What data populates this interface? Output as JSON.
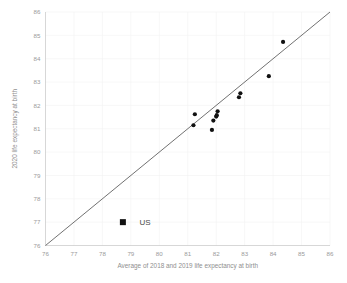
{
  "chart_data": {
    "type": "scatter",
    "title": "",
    "xlabel": "Average of 2018 and 2019 life expectancy at birth",
    "ylabel": "2020 life expectancy at birth",
    "xlim": [
      76,
      86
    ],
    "ylim": [
      76,
      86
    ],
    "xticks": [
      76,
      77,
      78,
      79,
      80,
      81,
      82,
      83,
      84,
      85,
      86
    ],
    "yticks": [
      76,
      77,
      78,
      79,
      80,
      81,
      82,
      83,
      84,
      85,
      86
    ],
    "xtick_labels": [
      "76",
      "77",
      "78",
      "79",
      "80",
      "81",
      "82",
      "83",
      "84",
      "85",
      "86"
    ],
    "ytick_labels": [
      "76",
      "77",
      "78",
      "79",
      "80",
      "81",
      "82",
      "83",
      "84",
      "85",
      "86"
    ],
    "grid": true,
    "legend_position": "inside-lower-left",
    "series": [
      {
        "name": "Other countries",
        "marker": "circle",
        "color": "#111111",
        "points": [
          {
            "x": 81.2,
            "y": 81.15
          },
          {
            "x": 81.25,
            "y": 81.62
          },
          {
            "x": 81.85,
            "y": 80.95
          },
          {
            "x": 81.9,
            "y": 81.35
          },
          {
            "x": 82.0,
            "y": 81.52
          },
          {
            "x": 82.02,
            "y": 81.58
          },
          {
            "x": 82.05,
            "y": 81.75
          },
          {
            "x": 82.8,
            "y": 82.35
          },
          {
            "x": 82.85,
            "y": 82.52
          },
          {
            "x": 83.85,
            "y": 83.25
          },
          {
            "x": 84.35,
            "y": 84.72
          }
        ]
      },
      {
        "name": "US",
        "marker": "square",
        "color": "#111111",
        "points": [
          {
            "x": 78.72,
            "y": 77.0
          }
        ]
      }
    ],
    "reference_line": {
      "name": "y = x identity line",
      "from": {
        "x": 76,
        "y": 76
      },
      "to": {
        "x": 86,
        "y": 86
      },
      "color": "#4d4d4d"
    },
    "annotations": [
      {
        "name": "us-label",
        "text": "US",
        "x": 79.3,
        "y": 77.0
      }
    ]
  },
  "legend": {
    "us_label": "US"
  },
  "colors": {
    "marker": "#111111",
    "reference_line": "#4d4d4d",
    "gridline": "#f2f2f2",
    "axis": "#c9c9c9",
    "tick_text": "#9a9a9a",
    "axis_title": "#8f8f8f"
  }
}
